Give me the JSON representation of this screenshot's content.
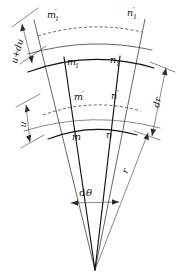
{
  "figure": {
    "kind": "geometry-diagram",
    "background_color": "#ffffff",
    "line_color": "#111111"
  },
  "labels": {
    "m1_prime": {
      "base": "m",
      "sub": "1",
      "prime": "′"
    },
    "n1_prime": {
      "base": "n",
      "sub": "1",
      "prime": "′"
    },
    "m1": {
      "base": "m",
      "sub": "1",
      "prime": ""
    },
    "n1": {
      "base": "n",
      "sub": "1",
      "prime": ""
    },
    "m_prime": {
      "base": "m",
      "sub": "",
      "prime": "′"
    },
    "n_prime": {
      "base": "n",
      "sub": "",
      "prime": "′"
    },
    "m": {
      "base": "m",
      "sub": "",
      "prime": ""
    },
    "n": {
      "base": "n",
      "sub": "",
      "prime": ""
    }
  },
  "dimensions": {
    "u_plus_du": "u+du",
    "u": "u",
    "dr": "dr",
    "r": "r",
    "d_theta_d": "d",
    "d_theta_theta": "θ"
  }
}
